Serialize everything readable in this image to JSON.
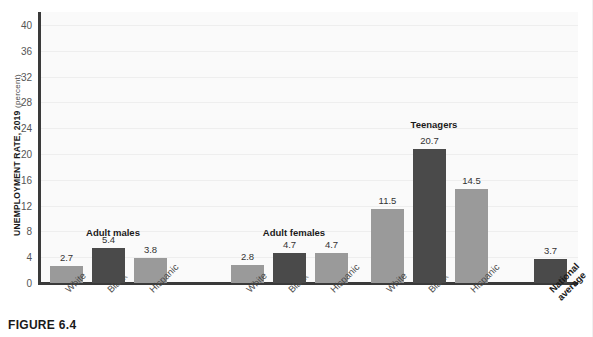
{
  "caption": "FIGURE 6.4",
  "axis": {
    "y_title_strong": "UNEMPLOYMENT RATE, 2019",
    "y_title_weak": "(percent)"
  },
  "colors": {
    "bar_dark": "#4a4a4a",
    "bar_light": "#9a9a9a",
    "axis": "#3a3a3a",
    "plot_bg": "#fafafa",
    "gridline": "#eeeeee"
  },
  "chart_data": {
    "type": "bar",
    "title": "",
    "xlabel": "",
    "ylabel": "UNEMPLOYMENT RATE, 2019 (percent)",
    "ylim": [
      0,
      42
    ],
    "yticks": [
      0,
      4,
      8,
      12,
      16,
      20,
      24,
      28,
      32,
      36,
      40
    ],
    "grid": true,
    "legend": "none",
    "group_labels": [
      "Adult males",
      "Adult females",
      "Teenagers"
    ],
    "categories": [
      "White",
      "Black",
      "Hispanic",
      "White",
      "Black",
      "Hispanic",
      "White",
      "Black",
      "Hispanic",
      "National average"
    ],
    "values": [
      2.7,
      5.4,
      3.8,
      2.8,
      4.7,
      4.7,
      11.5,
      20.7,
      14.5,
      3.7
    ],
    "bars": [
      {
        "label": "White",
        "label_line2": "",
        "value": 2.7,
        "value_text": "2.7",
        "shade": "light",
        "x": 9,
        "group": "Adult males",
        "bold_label": false
      },
      {
        "label": "Black",
        "label_line2": "",
        "value": 5.4,
        "value_text": "5.4",
        "shade": "dark",
        "x": 51,
        "group": "Adult males",
        "bold_label": false
      },
      {
        "label": "Hispanic",
        "label_line2": "",
        "value": 3.8,
        "value_text": "3.8",
        "shade": "light",
        "x": 93,
        "group": "Adult males",
        "bold_label": false
      },
      {
        "label": "White",
        "label_line2": "",
        "value": 2.8,
        "value_text": "2.8",
        "shade": "light",
        "x": 190,
        "group": "Adult females",
        "bold_label": false
      },
      {
        "label": "Black",
        "label_line2": "",
        "value": 4.7,
        "value_text": "4.7",
        "shade": "dark",
        "x": 232,
        "group": "Adult females",
        "bold_label": false
      },
      {
        "label": "Hispanic",
        "label_line2": "",
        "value": 4.7,
        "value_text": "4.7",
        "shade": "light",
        "x": 274,
        "group": "Adult females",
        "bold_label": false
      },
      {
        "label": "White",
        "label_line2": "",
        "value": 11.5,
        "value_text": "11.5",
        "shade": "light",
        "x": 330,
        "group": "Teenagers",
        "bold_label": false
      },
      {
        "label": "Black",
        "label_line2": "",
        "value": 20.7,
        "value_text": "20.7",
        "shade": "dark",
        "x": 372,
        "group": "Teenagers",
        "bold_label": false
      },
      {
        "label": "Hispanic",
        "label_line2": "",
        "value": 14.5,
        "value_text": "14.5",
        "shade": "light",
        "x": 414,
        "group": "Teenagers",
        "bold_label": false
      },
      {
        "label": "National",
        "label_line2": "average",
        "value": 3.7,
        "value_text": "3.7",
        "shade": "dark",
        "x": 493,
        "group": "",
        "bold_label": true
      }
    ],
    "groups": [
      {
        "label": "Adult males",
        "center_x": 72,
        "y": 227
      },
      {
        "label": "Adult females",
        "center_x": 253,
        "y": 227
      },
      {
        "label": "Teenagers",
        "center_x": 393,
        "y": 119
      }
    ]
  }
}
